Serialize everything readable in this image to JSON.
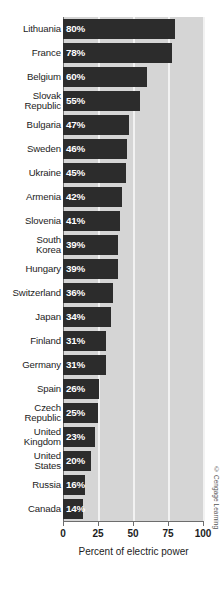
{
  "chart_data": {
    "type": "bar",
    "orientation": "horizontal",
    "title": "",
    "xlabel": "Percent of electric power",
    "ylabel": "",
    "xlim": [
      0,
      100
    ],
    "xticks": [
      "0",
      "25",
      "50",
      "75",
      "100"
    ],
    "xtick_values": [
      0,
      25,
      50,
      75,
      100
    ],
    "grid": true,
    "grid_axis": "x",
    "legend": "none",
    "categories": [
      "Lithuania",
      "France",
      "Belgium",
      "Slovak\nRepublic",
      "Bulgaria",
      "Sweden",
      "Ukraine",
      "Armenia",
      "Slovenia",
      "South\nKorea",
      "Hungary",
      "Switzerland",
      "Japan",
      "Finland",
      "Germany",
      "Spain",
      "Czech\nRepublic",
      "United\nKingdom",
      "United\nStates",
      "Russia",
      "Canada"
    ],
    "values": [
      80,
      78,
      60,
      55,
      47,
      46,
      45,
      42,
      41,
      39,
      39,
      36,
      34,
      31,
      31,
      26,
      25,
      23,
      20,
      16,
      14
    ],
    "value_labels": [
      "80%",
      "78%",
      "60%",
      "55%",
      "47%",
      "46%",
      "45%",
      "42%",
      "41%",
      "39%",
      "39%",
      "36%",
      "34%",
      "31%",
      "31%",
      "26%",
      "25%",
      "23%",
      "20%",
      "16%",
      "14%"
    ],
    "bar_color": "#2c2c2c",
    "value_label_color": "#ffffff",
    "plot_background": "#d5d5d5",
    "gridline_color": "#f2f2f2",
    "axis_color": "#6d6d6d"
  },
  "credit": {
    "text": "© Cengage Learning"
  }
}
